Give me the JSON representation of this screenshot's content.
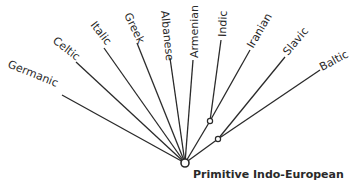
{
  "diagram": {
    "type": "tree",
    "root": {
      "id": "pie",
      "label": "Primitive Indo-European",
      "x": 185,
      "y": 163
    },
    "intermediate_nodes": [
      {
        "id": "indo-iranian",
        "x": 210,
        "y": 121
      },
      {
        "id": "balto-slavic",
        "x": 218,
        "y": 139
      }
    ],
    "branches": [
      {
        "id": "germanic",
        "label": "Germanic",
        "from": "pie",
        "end_x": 62,
        "end_y": 95,
        "label_x": 8,
        "label_y": 67,
        "angle": 24
      },
      {
        "id": "celtic",
        "label": "Celtic",
        "from": "pie",
        "end_x": 76,
        "end_y": 62,
        "label_x": 50,
        "label_y": 42,
        "angle": 38
      },
      {
        "id": "italic",
        "label": "Italic",
        "from": "pie",
        "end_x": 104,
        "end_y": 48,
        "label_x": 88,
        "label_y": 27,
        "angle": 52
      },
      {
        "id": "greek",
        "label": "Greek",
        "from": "pie",
        "end_x": 136,
        "end_y": 44,
        "label_x": 122,
        "label_y": 16,
        "angle": 64
      },
      {
        "id": "albanese",
        "label": "Albanese",
        "from": "pie",
        "end_x": 170,
        "end_y": 58,
        "label_x": 161,
        "label_y": 11,
        "angle": 82
      },
      {
        "id": "armenian",
        "label": "Armenian",
        "from": "pie",
        "end_x": 193,
        "end_y": 60,
        "label_x": 199,
        "label_y": 58,
        "angle": -90
      },
      {
        "id": "indic",
        "label": "Indic",
        "from": "indo-iranian",
        "end_x": 221,
        "end_y": 40,
        "label_x": 226,
        "label_y": 38,
        "angle": -90
      },
      {
        "id": "iranian",
        "label": "Iranian",
        "from": "indo-iranian",
        "end_x": 249,
        "end_y": 51,
        "label_x": 252,
        "label_y": 48,
        "angle": -58
      },
      {
        "id": "slavic",
        "label": "Slavic",
        "from": "balto-slavic",
        "end_x": 285,
        "end_y": 57,
        "label_x": 287,
        "label_y": 54,
        "angle": -50
      },
      {
        "id": "baltic",
        "label": "Baltic",
        "from": "balto-slavic",
        "end_x": 320,
        "end_y": 70,
        "label_x": 322,
        "label_y": 70,
        "angle": -28
      }
    ]
  },
  "labels": {
    "germanic": "Germanic",
    "celtic": "Celtic",
    "italic": "Italic",
    "greek": "Greek",
    "albanese": "Albanese",
    "armenian": "Armenian",
    "indic": "Indic",
    "iranian": "Iranian",
    "slavic": "Slavic",
    "baltic": "Baltic",
    "root": "Primitive Indo-European"
  }
}
